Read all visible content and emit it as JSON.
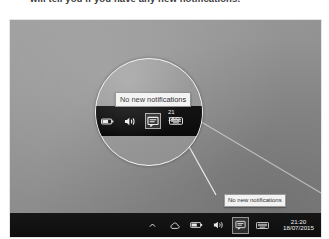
{
  "caption": {
    "text": "will tell you if you have any new notifications."
  },
  "photo": {
    "screen_color": "#949494",
    "taskbar_color": "#101010"
  },
  "taskbar": {
    "tray_icons": [
      {
        "name": "show-hidden-icons-icon",
        "label": "Show hidden icons",
        "glyph": "chevron-up",
        "highlight": false
      },
      {
        "name": "onedrive-icon",
        "label": "OneDrive",
        "glyph": "cloud",
        "highlight": false
      },
      {
        "name": "battery-icon",
        "label": "Battery",
        "glyph": "battery",
        "highlight": false
      },
      {
        "name": "volume-icon",
        "label": "Speakers",
        "glyph": "volume",
        "highlight": false
      },
      {
        "name": "action-center-icon",
        "label": "Action Center",
        "glyph": "notification",
        "highlight": true
      },
      {
        "name": "touch-keyboard-icon",
        "label": "Touch keyboard",
        "glyph": "keyboard",
        "highlight": false
      }
    ],
    "clock": {
      "time": "21:20",
      "date": "18/07/2015"
    }
  },
  "tooltip": {
    "text": "No new notifications"
  },
  "magnifier": {
    "tooltip_text": "No new notifications",
    "tray_icons": [
      {
        "name": "battery-icon",
        "label": "Battery",
        "glyph": "battery",
        "highlight": false
      },
      {
        "name": "volume-icon",
        "label": "Speakers",
        "glyph": "volume",
        "highlight": false
      },
      {
        "name": "action-center-icon",
        "label": "Action Center",
        "glyph": "notification",
        "highlight": true
      },
      {
        "name": "touch-keyboard-icon",
        "label": "Touch keyboard",
        "glyph": "keyboard",
        "highlight": false
      }
    ],
    "clock": {
      "time": "21",
      "date": "18/0"
    },
    "ring_color": "#f4f4f4"
  }
}
